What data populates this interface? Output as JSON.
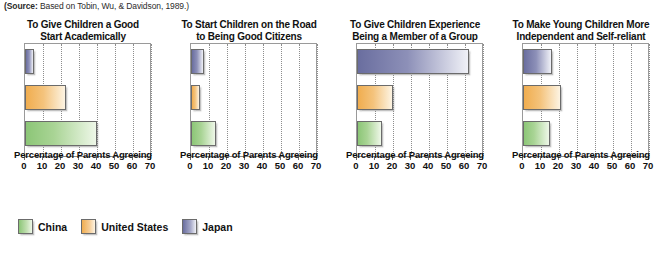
{
  "source_note": {
    "label": "(Source:",
    "text": " Based on Tobin, Wu, & Davidson, 1989.)"
  },
  "legend": {
    "position": "bottom-left",
    "items": [
      {
        "name": "China",
        "color": "#8cc677"
      },
      {
        "name": "United States",
        "color": "#f0ad4f"
      },
      {
        "name": "Japan",
        "color": "#6a6e9f"
      }
    ]
  },
  "axis": {
    "xlabel": "Percentage of Parents Agreeing",
    "ticks": [
      0,
      10,
      20,
      30,
      40,
      50,
      60,
      70
    ],
    "xlim": [
      0,
      70
    ]
  },
  "chart_data": [
    {
      "type": "bar",
      "orientation": "horizontal",
      "title": "To Give Children a Good Start Academically",
      "title_lines": [
        "To Give Children a Good",
        "Start Academically"
      ],
      "categories": [
        "Japan",
        "United States",
        "China"
      ],
      "values": [
        5,
        23,
        40
      ],
      "xlabel": "Percentage of Parents Agreeing",
      "ylabel": "",
      "xlim": [
        0,
        70
      ],
      "xticks": [
        0,
        10,
        20,
        30,
        40,
        50,
        60,
        70
      ],
      "grid": true,
      "legend_position": "bottom-left"
    },
    {
      "type": "bar",
      "orientation": "horizontal",
      "title": "To Start Children on the Road to Being Good Citizens",
      "title_lines": [
        "To Start Children on the Road",
        "to Being Good Citizens"
      ],
      "categories": [
        "Japan",
        "United States",
        "China"
      ],
      "values": [
        7,
        5,
        14
      ],
      "xlabel": "Percentage of Parents Agreeing",
      "ylabel": "",
      "xlim": [
        0,
        70
      ],
      "xticks": [
        0,
        10,
        20,
        30,
        40,
        50,
        60,
        70
      ],
      "grid": true,
      "legend_position": "bottom-left"
    },
    {
      "type": "bar",
      "orientation": "horizontal",
      "title": "To Give Children Experience Being a Member of a Group",
      "title_lines": [
        "To Give Children Experience",
        "Being a Member of a Group"
      ],
      "categories": [
        "Japan",
        "United States",
        "China"
      ],
      "values": [
        62,
        20,
        14
      ],
      "xlabel": "Percentage of Parents Agreeing",
      "ylabel": "",
      "xlim": [
        0,
        70
      ],
      "xticks": [
        0,
        10,
        20,
        30,
        40,
        50,
        60,
        70
      ],
      "grid": true,
      "legend_position": "bottom-left"
    },
    {
      "type": "bar",
      "orientation": "horizontal",
      "title": "To Make Young Children More Independent and Self-reliant",
      "title_lines": [
        "To Make Young Children More",
        "Independent and Self-reliant"
      ],
      "categories": [
        "Japan",
        "United States",
        "China"
      ],
      "values": [
        16,
        21,
        15
      ],
      "xlabel": "Percentage of Parents Agreeing",
      "ylabel": "",
      "xlim": [
        0,
        70
      ],
      "xticks": [
        0,
        10,
        20,
        30,
        40,
        50,
        60,
        70
      ],
      "grid": true,
      "legend_position": "bottom-left"
    }
  ]
}
